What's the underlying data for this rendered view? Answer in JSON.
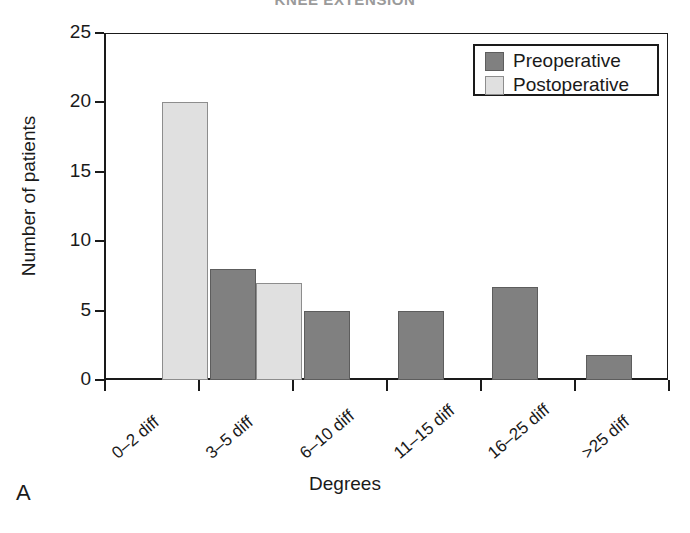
{
  "figure": {
    "panel_label": "A",
    "cut_title": "KNEE EXTENSION",
    "cut_title_page": ""
  },
  "legend": {
    "position": "top-right",
    "entries": [
      {
        "label": "Preoperative",
        "color": "#808080",
        "swatch": "pre"
      },
      {
        "label": "Postoperative",
        "color": "#e0e0e0",
        "swatch": "post"
      }
    ]
  },
  "axes": {
    "y_title": "Number of patients",
    "x_title": "Degrees",
    "y_ticks": [
      "0",
      "5",
      "10",
      "15",
      "20",
      "25"
    ]
  },
  "chart_data": {
    "type": "bar",
    "title": "",
    "subtitle": "",
    "xlabel": "Degrees",
    "ylabel": "Number of patients",
    "categories": [
      "0–2 diff",
      "3–5 diff",
      "6–10 diff",
      "11–15 diff",
      "16–25 diff",
      ">25 diff"
    ],
    "series": [
      {
        "name": "Preoperative",
        "color": "#808080",
        "values": [
          0,
          8,
          5,
          5,
          6.7,
          1.8
        ]
      },
      {
        "name": "Postoperative",
        "color": "#e0e0e0",
        "values": [
          20,
          7,
          0,
          0,
          0,
          0
        ]
      }
    ],
    "ylim": [
      0,
      25
    ],
    "yticks": [
      0,
      5,
      10,
      15,
      20,
      25
    ],
    "grid": false,
    "legend_position": "top-right",
    "xtick_label_rotation": -40
  }
}
